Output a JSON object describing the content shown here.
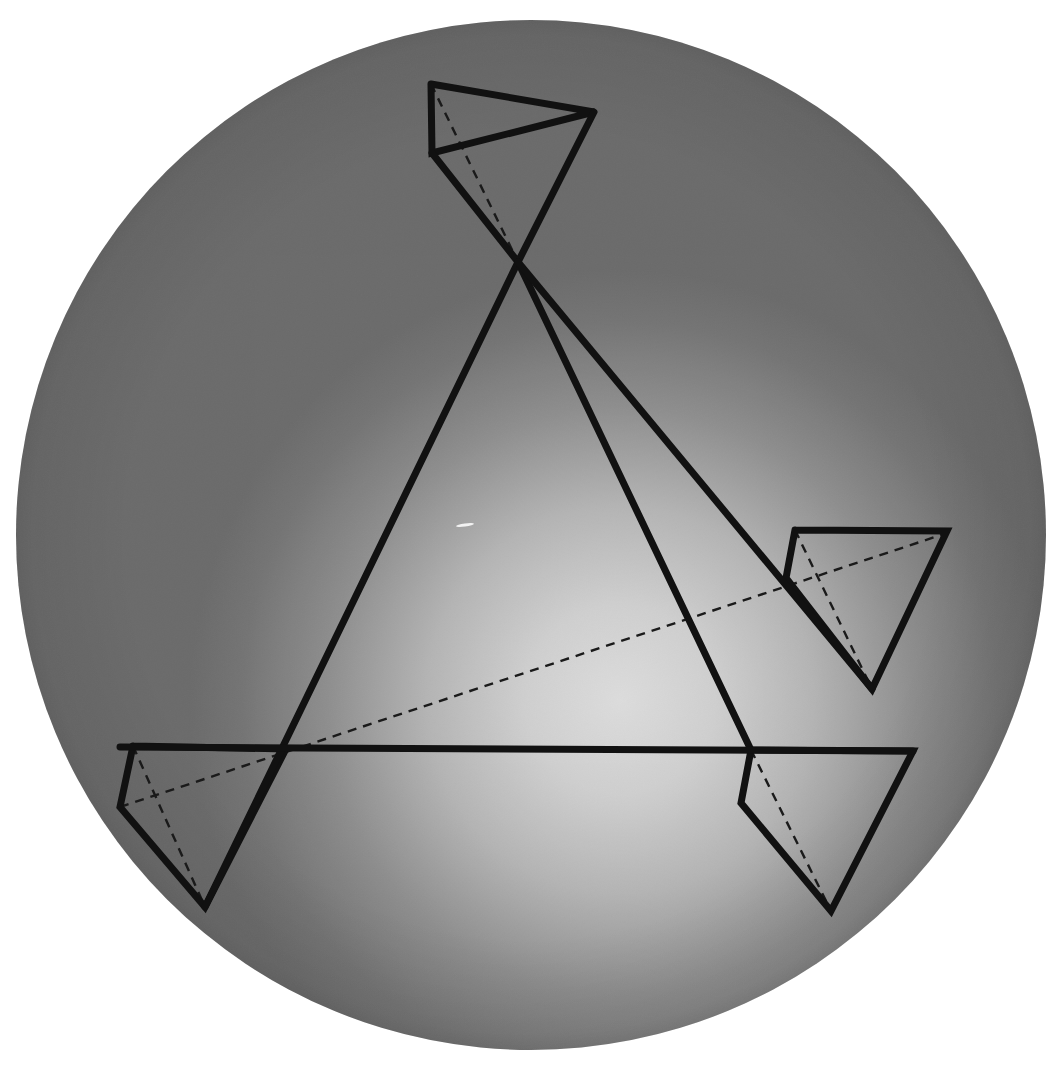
{
  "canvas": {
    "width": 1055,
    "height": 1091,
    "background_color": "#ffffff"
  },
  "scene": {
    "title": "",
    "description": "Projective geometry construction: four triangles on a shaded sphere with connecting lines",
    "sphere": {
      "center_x": 531,
      "center_y": 535,
      "radius": 515,
      "base_color": "#6e6e6e",
      "highlight_color": "#d7d7d7",
      "rim_color": "#6a6a6a",
      "highlight_center_x": 620,
      "highlight_center_y": 700,
      "highlight_radius": 430
    },
    "stroke": {
      "solid_color": "#111111",
      "solid_width": 7,
      "dashed_color": "#1a1a1a",
      "dashed_width": 2.4,
      "dash_pattern": "9 7"
    },
    "speck": {
      "x": 465,
      "y": 525,
      "width": 18,
      "height": 3,
      "color": "#f2f2f2",
      "angle": -8
    }
  },
  "chart_data": {
    "type": "diagram",
    "title": "",
    "xlabel": "",
    "ylabel": "",
    "xlim": [
      0,
      1055
    ],
    "ylim": [
      0,
      1091
    ],
    "grid": false,
    "legend": null,
    "points": {
      "A_top_left": [
        431,
        84
      ],
      "A_top_right": [
        594,
        112
      ],
      "A_mid_left": [
        432,
        153
      ],
      "A_apex": [
        518,
        262
      ],
      "B_top_left": [
        795,
        530
      ],
      "B_top_right": [
        947,
        531
      ],
      "B_mid_left": [
        786,
        578
      ],
      "B_apex": [
        872,
        689
      ],
      "C_top_left": [
        133,
        746
      ],
      "C_mid_left": [
        120,
        807
      ],
      "C_cross": [
        286,
        749
      ],
      "C_apex": [
        205,
        907
      ],
      "D_top_left": [
        751,
        750
      ],
      "D_top_right": [
        913,
        751
      ],
      "D_mid_left": [
        741,
        803
      ],
      "D_apex": [
        831,
        911
      ]
    },
    "solid_paths": [
      {
        "name": "triangle-top",
        "closed": false,
        "vertices": [
          [
            431,
            84
          ],
          [
            594,
            112
          ],
          [
            432,
            153
          ],
          [
            431,
            84
          ]
        ]
      },
      {
        "name": "triangle-top-lower-wedge",
        "closed": false,
        "vertices": [
          [
            432,
            153
          ],
          [
            518,
            262
          ],
          [
            594,
            112
          ]
        ]
      },
      {
        "name": "triangle-right",
        "closed": false,
        "vertices": [
          [
            795,
            530
          ],
          [
            947,
            531
          ],
          [
            872,
            689
          ],
          [
            786,
            578
          ],
          [
            795,
            530
          ]
        ]
      },
      {
        "name": "triangle-bottom-left",
        "closed": false,
        "vertices": [
          [
            133,
            746
          ],
          [
            286,
            749
          ],
          [
            205,
            907
          ],
          [
            120,
            807
          ],
          [
            133,
            746
          ]
        ]
      },
      {
        "name": "triangle-bottom-right",
        "closed": false,
        "vertices": [
          [
            751,
            750
          ],
          [
            913,
            751
          ],
          [
            831,
            911
          ],
          [
            741,
            803
          ],
          [
            751,
            750
          ]
        ]
      },
      {
        "name": "long-line-apex-to-bottom-left",
        "closed": false,
        "vertices": [
          [
            518,
            262
          ],
          [
            205,
            907
          ]
        ]
      },
      {
        "name": "long-line-apex-to-bottom-right",
        "closed": false,
        "vertices": [
          [
            518,
            262
          ],
          [
            751,
            750
          ]
        ]
      },
      {
        "name": "long-line-apex-to-right-triangle",
        "closed": false,
        "vertices": [
          [
            518,
            262
          ],
          [
            872,
            689
          ]
        ]
      },
      {
        "name": "horizontal-axis-line",
        "closed": false,
        "vertices": [
          [
            120,
            747
          ],
          [
            913,
            751
          ]
        ]
      }
    ],
    "dashed_paths": [
      {
        "name": "dashed-median-top-triangle",
        "vertices": [
          [
            431,
            84
          ],
          [
            518,
            262
          ]
        ]
      },
      {
        "name": "dashed-median-right-triangle",
        "vertices": [
          [
            795,
            530
          ],
          [
            872,
            689
          ]
        ]
      },
      {
        "name": "dashed-median-bottom-left-triangle",
        "vertices": [
          [
            133,
            746
          ],
          [
            205,
            907
          ]
        ]
      },
      {
        "name": "dashed-median-bottom-right-triangle",
        "vertices": [
          [
            751,
            750
          ],
          [
            831,
            911
          ]
        ]
      },
      {
        "name": "dashed-axis-of-perspectivity",
        "vertices": [
          [
            120,
            807
          ],
          [
            947,
            533
          ]
        ]
      }
    ]
  }
}
